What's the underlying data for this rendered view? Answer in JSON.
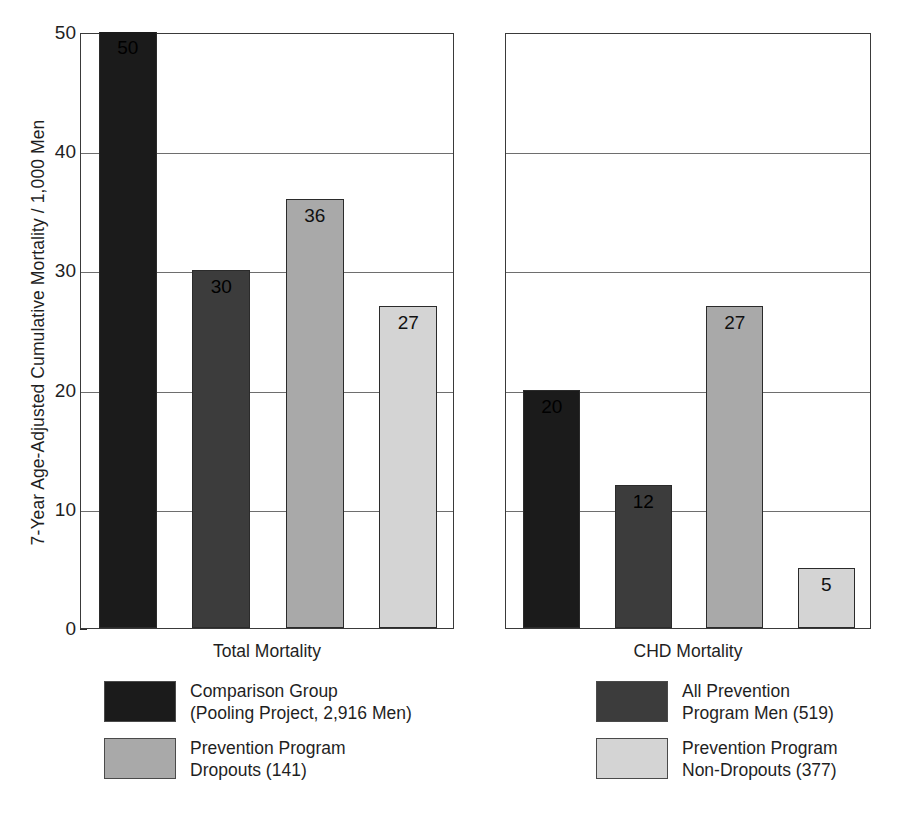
{
  "chart_data": {
    "type": "bar",
    "title": "",
    "subtitle": "",
    "xlabel": "",
    "ylabel": "7-Year Age-Adjusted Cumulative Mortality / 1,000 Men",
    "ylim": [
      0,
      50
    ],
    "yticks": [
      0,
      10,
      20,
      30,
      40,
      50
    ],
    "ytick_labels": [
      "0",
      "10",
      "20",
      "30",
      "40",
      "50"
    ],
    "grid": "horizontal",
    "legend_position": "below-panels",
    "categories": [
      "Total Mortality",
      "CHD Mortality"
    ],
    "series": [
      {
        "name": "Comparison Group (Pooling Project, 2,916 Men)",
        "color": "#1b1b1b",
        "values": [
          50,
          20
        ]
      },
      {
        "name": "All Prevention Program Men (519)",
        "color": "#3c3c3c",
        "values": [
          30,
          12
        ]
      },
      {
        "name": "Prevention Program Dropouts (141)",
        "color": "#a9a9a9",
        "values": [
          36,
          27
        ]
      },
      {
        "name": "Prevention Program Non-Dropouts (377)",
        "color": "#d4d4d4",
        "values": [
          27,
          5
        ]
      }
    ],
    "annotations": [
      {
        "panel": "Total Mortality",
        "series": "Comparison Group (Pooling Project, 2,916 Men)",
        "label": "50",
        "clipped_at_axis_max": true
      },
      {
        "panel": "Total Mortality",
        "series": "All Prevention Program Men (519)",
        "label": "30"
      },
      {
        "panel": "Total Mortality",
        "series": "Prevention Program Dropouts (141)",
        "label": "36"
      },
      {
        "panel": "Total Mortality",
        "series": "Prevention Program Non-Dropouts (377)",
        "label": "27"
      },
      {
        "panel": "CHD Mortality",
        "series": "Comparison Group (Pooling Project, 2,916 Men)",
        "label": "20"
      },
      {
        "panel": "CHD Mortality",
        "series": "All Prevention Program Men (519)",
        "label": "12"
      },
      {
        "panel": "CHD Mortality",
        "series": "Prevention Program Dropouts (141)",
        "label": "27"
      },
      {
        "panel": "CHD Mortality",
        "series": "Prevention Program Non-Dropouts (377)",
        "label": "5"
      }
    ]
  },
  "axis": {
    "y_title": "7-Year Age-Adjusted Cumulative Mortality / 1,000 Men",
    "ticks": [
      {
        "label": "50",
        "value": 50
      },
      {
        "label": "40",
        "value": 40
      },
      {
        "label": "30",
        "value": 30
      },
      {
        "label": "20",
        "value": 20
      },
      {
        "label": "10",
        "value": 10
      },
      {
        "label": "0",
        "value": 0
      }
    ]
  },
  "panels": [
    {
      "id": "left",
      "category": "Total Mortality",
      "bars": [
        {
          "label": "50",
          "value": 50,
          "shade": "swatch-black",
          "clipped": true
        },
        {
          "label": "30",
          "value": 30,
          "shade": "swatch-dark",
          "clipped": false
        },
        {
          "label": "36",
          "value": 36,
          "shade": "swatch-medium",
          "clipped": false
        },
        {
          "label": "27",
          "value": 27,
          "shade": "swatch-light",
          "clipped": false
        }
      ]
    },
    {
      "id": "right",
      "category": "CHD Mortality",
      "bars": [
        {
          "label": "20",
          "value": 20,
          "shade": "swatch-black",
          "clipped": false
        },
        {
          "label": "12",
          "value": 12,
          "shade": "swatch-dark",
          "clipped": false
        },
        {
          "label": "27",
          "value": 27,
          "shade": "swatch-medium",
          "clipped": false
        },
        {
          "label": "5",
          "value": 5,
          "shade": "swatch-light",
          "clipped": false
        }
      ]
    }
  ],
  "legend_left": {
    "entries": [
      {
        "shade": "swatch-black",
        "text": "Comparison Group\n(Pooling Project, 2,916 Men)"
      },
      {
        "shade": "swatch-medium",
        "text": "Prevention Program\nDropouts (141)"
      }
    ]
  },
  "legend_right": {
    "entries": [
      {
        "shade": "swatch-dark",
        "text": "All Prevention\nProgram Men (519)"
      },
      {
        "shade": "swatch-light",
        "text": "Prevention Program\nNon-Dropouts (377)"
      }
    ]
  },
  "colors": {
    "comparison_group": "#1b1b1b",
    "all_prevention_men": "#3c3c3c",
    "dropouts": "#a9a9a9",
    "non_dropouts": "#d4d4d4",
    "axis": "#3a3a3a",
    "gridline": "#6e6e6e",
    "background": "#ffffff"
  }
}
